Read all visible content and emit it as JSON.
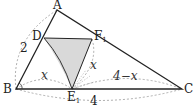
{
  "diagram": {
    "type": "geometry-triangle-fold",
    "points": {
      "A": {
        "label": "A",
        "x": 57,
        "y": 10
      },
      "B": {
        "label": "B",
        "x": 16,
        "y": 89
      },
      "C": {
        "label": "C",
        "x": 182,
        "y": 89
      },
      "D": {
        "label": "D",
        "x": 44,
        "y": 38
      },
      "F": {
        "label": "F",
        "sub": "1",
        "x": 92,
        "y": 39
      },
      "E": {
        "label": "E",
        "sub": "1",
        "x": 72,
        "y": 89
      }
    },
    "labels": {
      "AB_part": "2",
      "BE": "x",
      "FE": "x",
      "EC": "4−x",
      "BC": "4"
    },
    "colors": {
      "line": "#222222",
      "shade": "#d9d9d9",
      "dashed": "#888888"
    }
  }
}
